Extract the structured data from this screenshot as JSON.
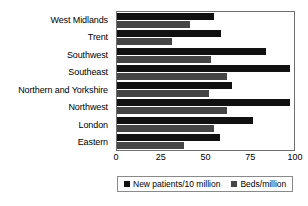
{
  "chart_data": {
    "type": "bar",
    "orientation": "horizontal",
    "title": "",
    "xlabel": "",
    "ylabel": "",
    "xlim": [
      0,
      100
    ],
    "xticks": [
      0,
      25,
      50,
      75,
      100
    ],
    "grid": false,
    "legend_position": "bottom",
    "categories": [
      "West Midlands",
      "Trent",
      "Southwest",
      "Southeast",
      "Northern and Yorkshire",
      "Northwest",
      "London",
      "Eastern"
    ],
    "series": [
      {
        "name": "New patients/10 million",
        "color": "#111111",
        "values": [
          55,
          59,
          84,
          98,
          65,
          98,
          77,
          58
        ]
      },
      {
        "name": "Beds/million",
        "color": "#454545",
        "values": [
          41,
          31,
          53,
          62,
          52,
          62,
          55,
          38
        ]
      }
    ]
  },
  "legend": {
    "items": [
      {
        "label": "New patients/10 million"
      },
      {
        "label": "Beds/million"
      }
    ]
  }
}
